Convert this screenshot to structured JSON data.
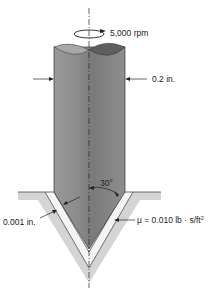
{
  "diagram": {
    "labels": {
      "speed": "5,000 rpm",
      "diameter": "0.2 in.",
      "angle": "30°",
      "gap": "0.001 in.",
      "viscosity_prefix": "μ = 0.010 lb · s/ft",
      "viscosity_exp": "2"
    },
    "colors": {
      "shaft_dark": "#6e6e6e",
      "shaft_light": "#b5b5b5",
      "housing": "#d4d4d4",
      "film": "#f2f2f2",
      "line": "#222222"
    }
  }
}
